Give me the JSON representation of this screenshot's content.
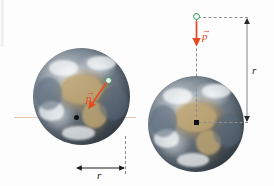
{
  "figure": {
    "background_color": "#fdfdfd"
  },
  "colors": {
    "vector": "#e8481f",
    "marker_outline": "#2f9b58",
    "axis_horizontal": "#e7c9ac",
    "axis_vertical": "#a99f92",
    "dashed_line": "#8d8d8d",
    "center_marker": "#111111",
    "label_text": "#1b1b1b"
  },
  "panels": [
    {
      "id": "left-panel",
      "name": "oblique-momentum-panel",
      "body_label": "earth-globe",
      "center_marker": "center-dot",
      "particle_marker": "green-circle",
      "vector": {
        "label": "p",
        "vector_bar": "→",
        "direction": "down-left",
        "color": "#e8481f"
      },
      "measurement": {
        "label": "r",
        "orientation": "horizontal",
        "arrow_style": "double-headed"
      },
      "axes": {
        "horizontal": true,
        "vertical": true
      }
    },
    {
      "id": "right-panel",
      "name": "radial-momentum-panel",
      "body_label": "earth-globe",
      "center_marker": "center-square",
      "particle_marker": "green-circle",
      "vector": {
        "label": "p",
        "vector_bar": "→",
        "direction": "down",
        "color": "#e8481f"
      },
      "measurement": {
        "label": "r",
        "orientation": "vertical",
        "arrow_style": "double-headed"
      },
      "axes": {
        "horizontal": false,
        "vertical": false
      }
    }
  ]
}
